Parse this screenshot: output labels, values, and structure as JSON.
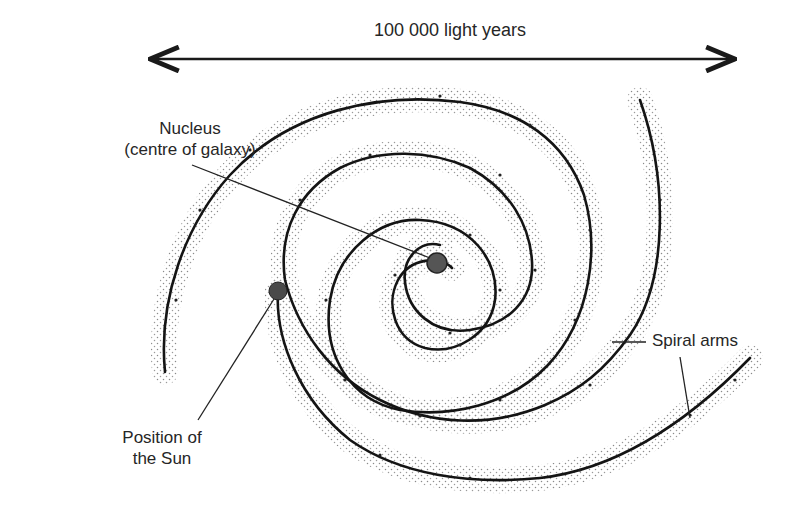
{
  "diagram": {
    "type": "spiral galaxy (Milky Way) schematic",
    "scale": {
      "label": "100 000 light years",
      "arrow": "double-headed horizontal"
    },
    "labels": {
      "nucleus": {
        "line1": "Nucleus",
        "line2": "(centre of galaxy)"
      },
      "sun": {
        "line1": "Position of",
        "line2": "the Sun"
      },
      "spiral_arms": "Spiral arms"
    },
    "colors": {
      "ink": "#1a1a1a",
      "nucleus_fill": "#555555",
      "sun_fill": "#4a4a4a",
      "stipple": "#9a9a9a"
    }
  }
}
